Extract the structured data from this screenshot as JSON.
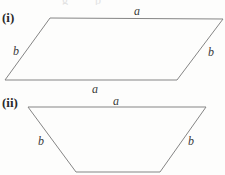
{
  "figure": {
    "background_color": "#fdfdfc",
    "stroke_color": "#858585",
    "stroke_width": 1,
    "width": 225,
    "height": 175
  },
  "parts": [
    {
      "key": "part-i",
      "marker": "(i)",
      "shape": "parallelogram",
      "marker_position": {
        "x": 2,
        "y": 11
      },
      "vertices": [
        {
          "x": 50,
          "y": 18
        },
        {
          "x": 223,
          "y": 19
        },
        {
          "x": 177,
          "y": 80
        },
        {
          "x": 5,
          "y": 80
        }
      ],
      "labels": [
        {
          "key": "top-a",
          "text": "a",
          "x": 134,
          "y": 5
        },
        {
          "key": "left-b",
          "text": "b",
          "x": 13,
          "y": 45
        },
        {
          "key": "right-b",
          "text": "b",
          "x": 208,
          "y": 46
        },
        {
          "key": "bottom-a",
          "text": "a",
          "x": 92,
          "y": 83
        }
      ]
    },
    {
      "key": "part-ii",
      "marker": "(ii)",
      "shape": "trapezium",
      "marker_position": {
        "x": 2,
        "y": 96
      },
      "vertices": [
        {
          "x": 28,
          "y": 107
        },
        {
          "x": 206,
          "y": 107
        },
        {
          "x": 160,
          "y": 172
        },
        {
          "x": 76,
          "y": 172
        }
      ],
      "labels": [
        {
          "key": "top-a",
          "text": "a",
          "x": 113,
          "y": 95
        },
        {
          "key": "left-b",
          "text": "b",
          "x": 38,
          "y": 135
        },
        {
          "key": "right-b",
          "text": "b",
          "x": 188,
          "y": 135
        }
      ]
    }
  ],
  "top_crop_glyphs": [
    {
      "key": "crop-glyph-1",
      "text": "g",
      "x": 62,
      "y": -6
    },
    {
      "key": "crop-glyph-2",
      "text": "p",
      "x": 95,
      "y": -6
    }
  ]
}
